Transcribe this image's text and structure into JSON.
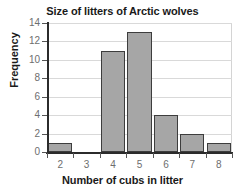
{
  "chart_data": {
    "type": "bar",
    "title": "Size of litters of Arctic wolves",
    "xlabel": "Number of cubs in litter",
    "ylabel": "Frequency",
    "categories": [
      "2",
      "3",
      "4",
      "5",
      "6",
      "7",
      "8"
    ],
    "values": [
      1,
      0,
      11,
      13,
      4,
      2,
      1
    ],
    "xtick_labels": [
      "2",
      "3",
      "4",
      "5",
      "6",
      "7",
      "8"
    ],
    "ytick_labels": [
      "0",
      "2",
      "4",
      "6",
      "8",
      "10",
      "12",
      "14"
    ],
    "ytick_values": [
      0,
      2,
      4,
      6,
      8,
      10,
      12,
      14
    ],
    "ylim": [
      0,
      14
    ],
    "grid": "horizontal",
    "legend": "none",
    "bar_fill_color": "#a6a6a6",
    "bar_edge_color": "#3d3d3d",
    "grid_color": "#d9d9d9",
    "axis_color": "#2b2b2b",
    "tick_label_color": "#6e6e6e",
    "title_color": "#1a1a1a",
    "background_color": "#ffffff"
  }
}
